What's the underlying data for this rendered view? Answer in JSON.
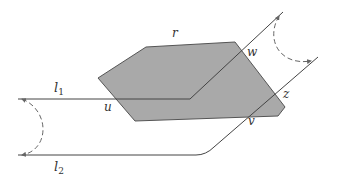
{
  "diagram": {
    "type": "geometric-figure",
    "colors": {
      "polygon_fill": "#a9a9a9",
      "polygon_stroke": "#555555",
      "line": "#444444",
      "dashed": "#666666",
      "label": "#333333"
    },
    "labels": {
      "r": "r",
      "w": "w",
      "u": "u",
      "z": "z",
      "v": "v",
      "l1_base": "l",
      "l1_sub": "1",
      "l2_base": "l",
      "l2_sub": "2"
    },
    "polygon_points": "98,78 146,47 235,42 285,107 278,116 135,121",
    "paths": {
      "l1": "M18,99 L190,99 L283,12",
      "l2": "M18,155 L196,155 Q206,155 214,147 L318,57"
    },
    "arcs": {
      "left": "M22,99 C50,110 50,150 22,155",
      "right": "M279,16 C265,40 280,66 311,61"
    }
  }
}
